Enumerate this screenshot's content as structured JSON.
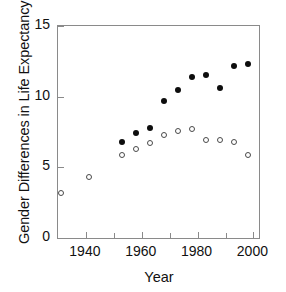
{
  "chart_data": {
    "type": "scatter",
    "title": "",
    "xlabel": "Year",
    "ylabel": "Gender Differences in Life Expectancy",
    "xlim": [
      1930,
      2002
    ],
    "ylim": [
      0,
      15
    ],
    "xticks": [
      1940,
      1960,
      1980,
      2000
    ],
    "xticklabels": [
      "1940",
      "1960",
      "1980",
      "2000"
    ],
    "xminorticks": [
      1950,
      1970,
      1990
    ],
    "yticks": [
      0,
      5,
      10,
      15
    ],
    "yticklabels": [
      "0",
      "5",
      "10",
      "15"
    ],
    "grid": false,
    "legend": "none",
    "series": [
      {
        "name": "filled-circles",
        "marker": "filled circle",
        "color": "#0d0d0d",
        "points": [
          {
            "x": 1953,
            "y": 6.8
          },
          {
            "x": 1958,
            "y": 7.4
          },
          {
            "x": 1963,
            "y": 7.8
          },
          {
            "x": 1968,
            "y": 9.7
          },
          {
            "x": 1973,
            "y": 10.5
          },
          {
            "x": 1978,
            "y": 11.4
          },
          {
            "x": 1983,
            "y": 11.5
          },
          {
            "x": 1988,
            "y": 10.6
          },
          {
            "x": 1993,
            "y": 12.2
          },
          {
            "x": 1998,
            "y": 12.3
          }
        ]
      },
      {
        "name": "open-circles",
        "marker": "open circle",
        "color": "#4a4a4a",
        "points": [
          {
            "x": 1931,
            "y": 3.2
          },
          {
            "x": 1941,
            "y": 4.3
          },
          {
            "x": 1953,
            "y": 5.9
          },
          {
            "x": 1958,
            "y": 6.3
          },
          {
            "x": 1963,
            "y": 6.7
          },
          {
            "x": 1968,
            "y": 7.3
          },
          {
            "x": 1973,
            "y": 7.6
          },
          {
            "x": 1978,
            "y": 7.7
          },
          {
            "x": 1983,
            "y": 6.9
          },
          {
            "x": 1988,
            "y": 6.9
          },
          {
            "x": 1993,
            "y": 6.8
          },
          {
            "x": 1998,
            "y": 5.9
          }
        ]
      }
    ]
  }
}
